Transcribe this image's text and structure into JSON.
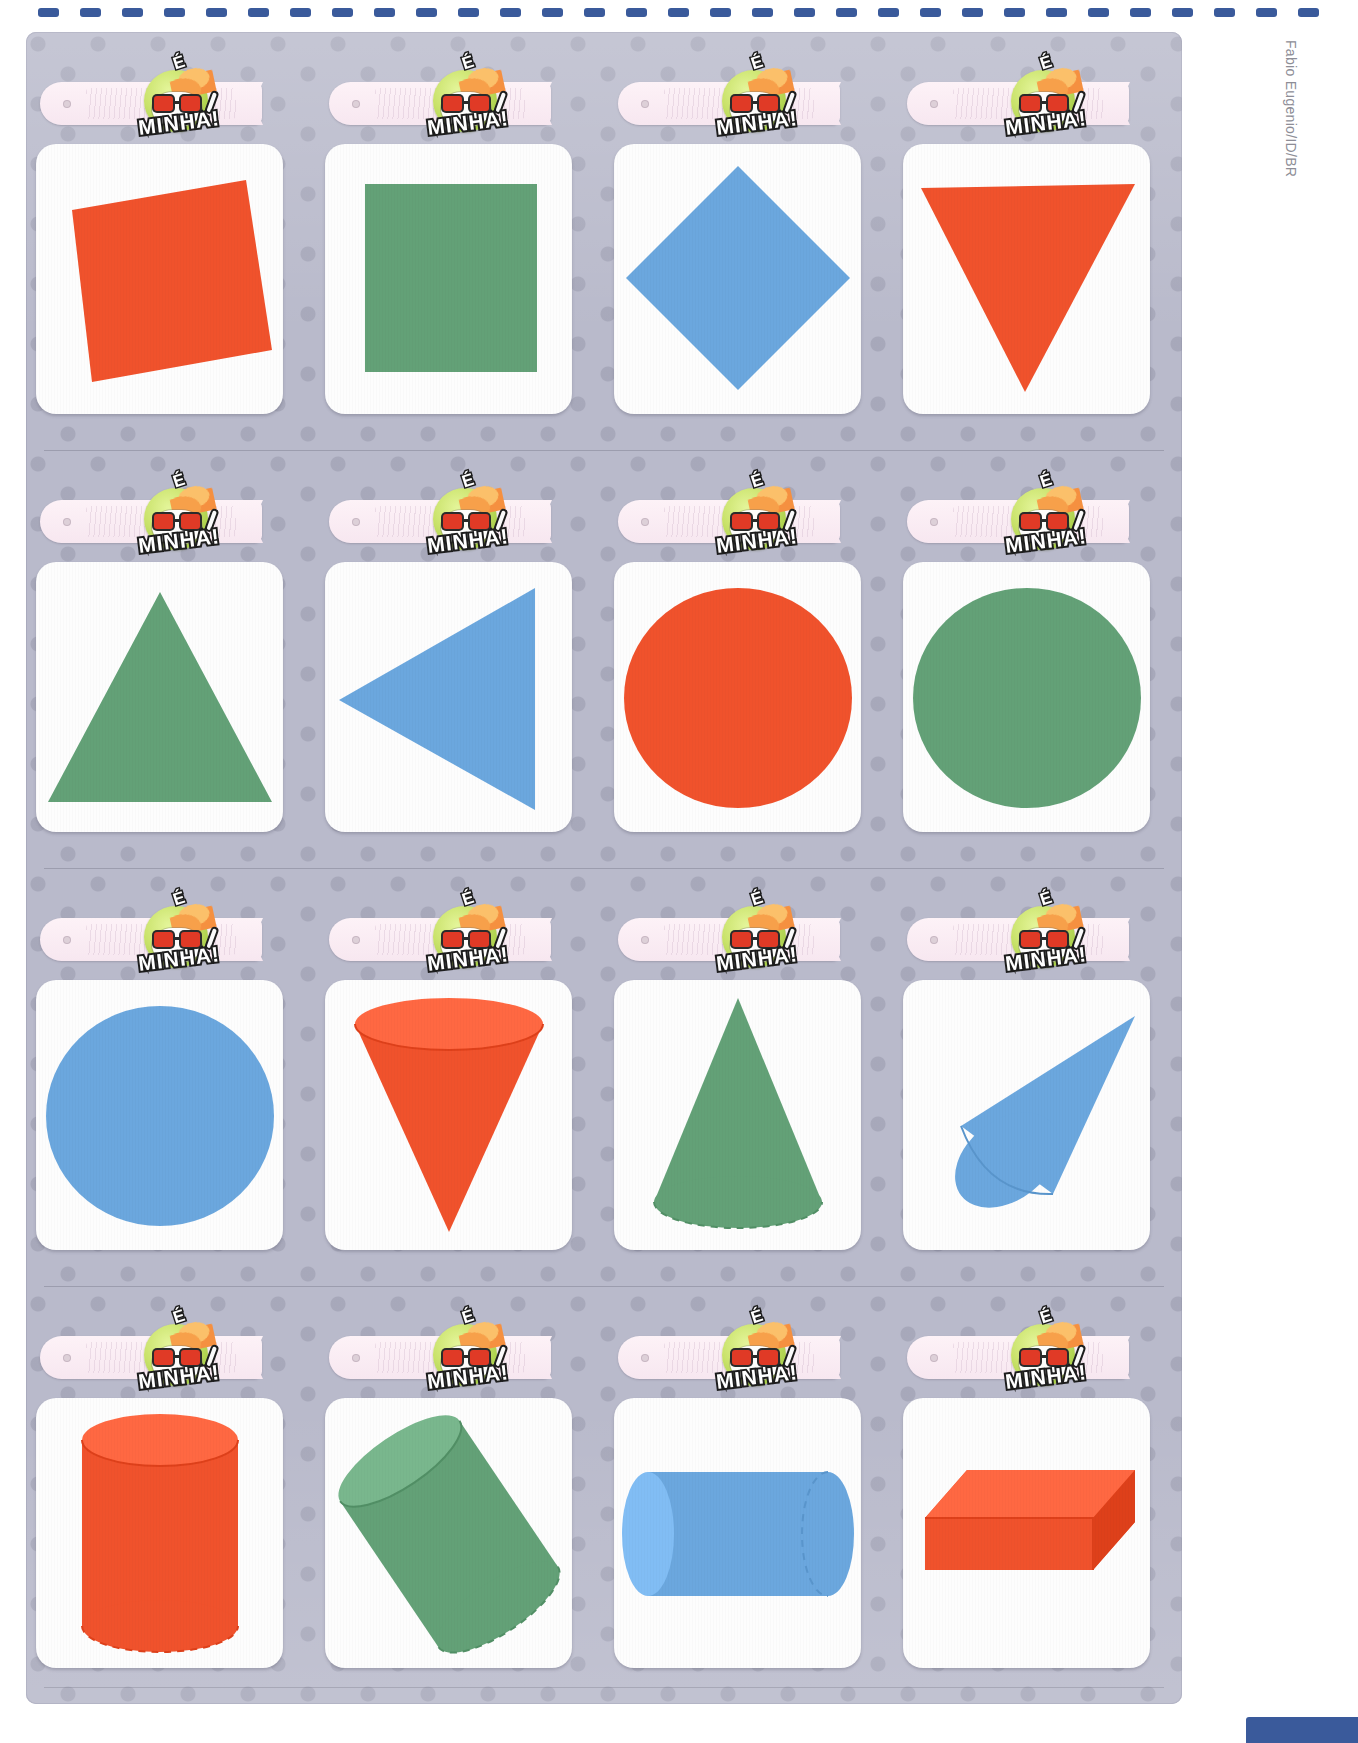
{
  "page": {
    "credit": "Fabio Eugenio/ID/BR",
    "binding_dots": 31,
    "colors": {
      "orange": "#f0522c",
      "orange_light": "#f4754f",
      "green": "#63a177",
      "green_light": "#7cb48c",
      "blue": "#6ba7de",
      "blue_light": "#8cbce8",
      "sheet_bg": "#b9bacb",
      "tag_bg": "#fdf2f7",
      "binding_blue": "#3a5a9b",
      "card_white": "#fdfdfd"
    }
  },
  "badge": {
    "e_text": "É",
    "word": "MINHA!",
    "icon": "kid-face-sticker-icon"
  },
  "cards": [
    {
      "row": 1,
      "col": 1,
      "shape": "square-tilted",
      "label": "",
      "color": "#f0522c",
      "icon": "square-icon"
    },
    {
      "row": 1,
      "col": 2,
      "shape": "square",
      "label": "",
      "color": "#63a177",
      "icon": "square-icon"
    },
    {
      "row": 1,
      "col": 3,
      "shape": "diamond",
      "label": "",
      "color": "#6ba7de",
      "icon": "diamond-icon"
    },
    {
      "row": 1,
      "col": 4,
      "shape": "triangle-down",
      "label": "",
      "color": "#f0522c",
      "icon": "triangle-icon"
    },
    {
      "row": 2,
      "col": 1,
      "shape": "triangle-up",
      "label": "",
      "color": "#63a177",
      "icon": "triangle-icon"
    },
    {
      "row": 2,
      "col": 2,
      "shape": "triangle-left",
      "label": "",
      "color": "#6ba7de",
      "icon": "triangle-icon"
    },
    {
      "row": 2,
      "col": 3,
      "shape": "circle",
      "label": "",
      "color": "#f0522c",
      "icon": "circle-icon"
    },
    {
      "row": 2,
      "col": 4,
      "shape": "circle",
      "label": "",
      "color": "#63a177",
      "icon": "circle-icon"
    },
    {
      "row": 3,
      "col": 1,
      "shape": "circle",
      "label": "",
      "color": "#6ba7de",
      "icon": "circle-icon"
    },
    {
      "row": 3,
      "col": 2,
      "shape": "cone-down",
      "label": "",
      "color": "#f0522c",
      "icon": "cone-icon"
    },
    {
      "row": 3,
      "col": 3,
      "shape": "cone-up",
      "label": "",
      "color": "#63a177",
      "icon": "cone-icon"
    },
    {
      "row": 3,
      "col": 4,
      "shape": "cone-tilted",
      "label": "",
      "color": "#6ba7de",
      "icon": "cone-icon"
    },
    {
      "row": 4,
      "col": 1,
      "shape": "cylinder-vertical",
      "label": "",
      "color": "#f0522c",
      "icon": "cylinder-icon"
    },
    {
      "row": 4,
      "col": 2,
      "shape": "cylinder-tilted",
      "label": "",
      "color": "#63a177",
      "icon": "cylinder-icon"
    },
    {
      "row": 4,
      "col": 3,
      "shape": "cylinder-horizontal",
      "label": "",
      "color": "#6ba7de",
      "icon": "cylinder-icon"
    },
    {
      "row": 4,
      "col": 4,
      "shape": "rectangular-prism",
      "label": "",
      "color": "#f0522c",
      "icon": "cuboid-icon"
    }
  ]
}
